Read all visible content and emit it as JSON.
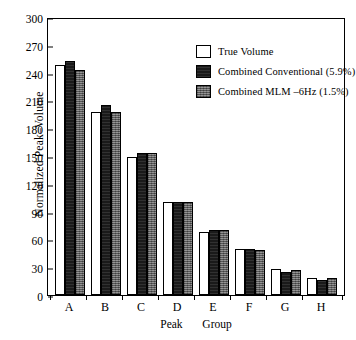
{
  "chart_data": {
    "type": "bar",
    "title": "",
    "xlabel": "Peak   Group",
    "ylabel": "Normalized Peak–Volume",
    "categories": [
      "A",
      "B",
      "C",
      "D",
      "E",
      "F",
      "G",
      "H"
    ],
    "ylim": [
      0,
      300
    ],
    "yticks": [
      0,
      30,
      60,
      90,
      120,
      150,
      180,
      210,
      240,
      270,
      300
    ],
    "grid": false,
    "legend_position": "top-right",
    "series": [
      {
        "name": "True Volume",
        "color": "#ffffff",
        "values": [
          248,
          198,
          149,
          100,
          68,
          50,
          28,
          18
        ]
      },
      {
        "name": "Combined Conventional (5.9%)",
        "color": "#1a1a1a",
        "values": [
          252,
          205,
          153,
          100,
          70,
          50,
          25,
          16
        ]
      },
      {
        "name": "Combined MLM –6Hz (1.5%)",
        "color": "#6f6f6f",
        "values": [
          243,
          198,
          153,
          100,
          70,
          49,
          27,
          18
        ]
      }
    ]
  },
  "axis": {
    "y_title": "Normalized Peak–Volume",
    "x_title_part1": "Peak",
    "x_title_part2": "Group"
  }
}
